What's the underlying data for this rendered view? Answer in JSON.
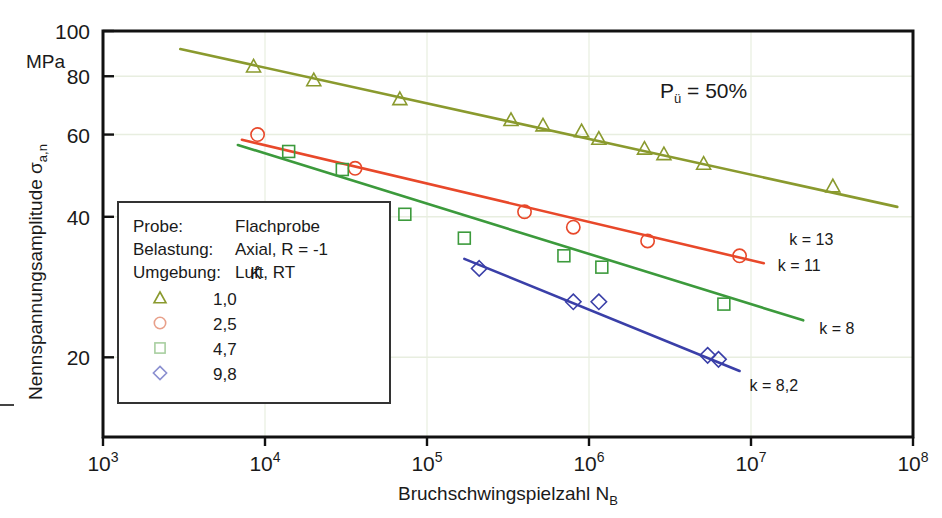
{
  "chart_data": {
    "type": "scatter",
    "title": "",
    "xlabel": "Bruchschwingspielzahl N_B",
    "xlabel_main": "Bruchschwingspielzahl N",
    "xlabel_sub": "B",
    "ylabel_main": "Nennspannungsamplitude ",
    "ylabel_sym": "σ",
    "ylabel_sub": "a,n",
    "yunit": "MPa",
    "xscale": "log",
    "yscale": "log",
    "xlim": [
      1000,
      100000000
    ],
    "ylim": [
      13.5,
      100
    ],
    "xticks": [
      {
        "value": 1000,
        "mant": "10",
        "exp": "3"
      },
      {
        "value": 10000,
        "mant": "10",
        "exp": "4"
      },
      {
        "value": 100000,
        "mant": "10",
        "exp": "5"
      },
      {
        "value": 1000000,
        "mant": "10",
        "exp": "6"
      },
      {
        "value": 10000000,
        "mant": "10",
        "exp": "7"
      },
      {
        "value": 100000000,
        "mant": "10",
        "exp": "8"
      }
    ],
    "yticks": [
      {
        "value": 100,
        "label": "100"
      },
      {
        "value": 80,
        "label": "80"
      },
      {
        "value": 60,
        "label": "60"
      },
      {
        "value": 40,
        "label": "40"
      },
      {
        "value": 20,
        "label": "20"
      }
    ],
    "grid": true,
    "grid_color": "#e8eee0",
    "annotation_pu": "Pü = 50%",
    "annotation_pu_main": "P",
    "annotation_pu_sub": "ü",
    "annotation_pu_rest": " = 50%",
    "series": [
      {
        "name": "K 1,0",
        "legend_label": "1,0",
        "marker": "triangle",
        "color": "#8a9a2e",
        "k_label": "k = 13",
        "k_value": 13,
        "fit_line": {
          "x1": 3000,
          "y1": 91.5,
          "x2": 80000000,
          "y2": 42.0
        },
        "points": [
          {
            "x": 8500,
            "y": 84.0
          },
          {
            "x": 20000,
            "y": 78.5
          },
          {
            "x": 68000,
            "y": 71.5
          },
          {
            "x": 330000,
            "y": 64.5
          },
          {
            "x": 520000,
            "y": 62.8
          },
          {
            "x": 900000,
            "y": 61.0
          },
          {
            "x": 1150000,
            "y": 58.8
          },
          {
            "x": 2200000,
            "y": 56.0
          },
          {
            "x": 2900000,
            "y": 54.5
          },
          {
            "x": 5100000,
            "y": 52.0
          },
          {
            "x": 32000000,
            "y": 46.5
          }
        ]
      },
      {
        "name": "K 2,5",
        "legend_label": "2,5",
        "marker": "circle",
        "color": "#e8482a",
        "k_label": "k = 11",
        "k_value": 11,
        "fit_line": {
          "x1": 7200,
          "y1": 58.5,
          "x2": 12000000,
          "y2": 31.8
        },
        "points": [
          {
            "x": 9000,
            "y": 60.0
          },
          {
            "x": 36000,
            "y": 50.8
          },
          {
            "x": 400000,
            "y": 41.0
          },
          {
            "x": 800000,
            "y": 38.0
          },
          {
            "x": 2300000,
            "y": 35.5
          },
          {
            "x": 8500000,
            "y": 33.0
          }
        ]
      },
      {
        "name": "K 4,7",
        "legend_label": "4,7",
        "marker": "square",
        "color": "#3c9a3c",
        "k_label": "k = 8",
        "k_value": 8,
        "fit_line": {
          "x1": 6800,
          "y1": 57.0,
          "x2": 21000000,
          "y2": 24.0
        },
        "points": [
          {
            "x": 14000,
            "y": 55.2
          },
          {
            "x": 30000,
            "y": 50.5
          },
          {
            "x": 73000,
            "y": 40.5
          },
          {
            "x": 170000,
            "y": 36.0
          },
          {
            "x": 700000,
            "y": 33.0
          },
          {
            "x": 1200000,
            "y": 31.2
          },
          {
            "x": 6800000,
            "y": 26.0
          }
        ]
      },
      {
        "name": "K 9,8",
        "legend_label": "9,8",
        "marker": "diamond",
        "color": "#3a3fa8",
        "k_label": "k = 8,2",
        "k_value": 8.2,
        "fit_line": {
          "x1": 170000,
          "y1": 32.5,
          "x2": 8500000,
          "y2": 18.7
        },
        "points": [
          {
            "x": 210000,
            "y": 31.0
          },
          {
            "x": 800000,
            "y": 26.3
          },
          {
            "x": 1150000,
            "y": 26.3
          },
          {
            "x": 5400000,
            "y": 20.2
          },
          {
            "x": 6300000,
            "y": 19.8
          }
        ]
      }
    ]
  },
  "legend": {
    "rows": [
      {
        "label": "Probe:",
        "value": "Flachprobe"
      },
      {
        "label": "Belastung:",
        "value": "Axial, R = -1"
      },
      {
        "label": "Umgebung:",
        "value": "Luft, RT"
      }
    ],
    "header": "K",
    "entries": [
      {
        "marker": "triangle",
        "color": "#8a9a2e",
        "label": "1,0"
      },
      {
        "marker": "circle",
        "color": "#e8a08a",
        "label": "2,5"
      },
      {
        "marker": "square",
        "color": "#a8cfa0",
        "label": "4,7"
      },
      {
        "marker": "diamond",
        "color": "#8a8fd0",
        "label": "9,8"
      }
    ]
  }
}
